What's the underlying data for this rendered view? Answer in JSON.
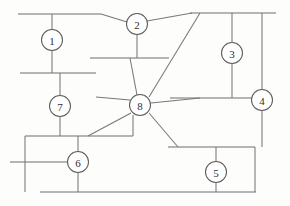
{
  "diagram": {
    "type": "single-line-network",
    "canvas": {
      "width": 290,
      "height": 206,
      "background": "#fdfdfc"
    },
    "style": {
      "line_color": "#6f6f72",
      "node_stroke": "#5d5d60",
      "node_fill": "#ffffff",
      "label_color": "#2f2f32"
    },
    "nodes": [
      {
        "id": "1",
        "label": "1",
        "cx": 52,
        "cy": 40,
        "r": 10.5
      },
      {
        "id": "2",
        "label": "2",
        "cx": 137,
        "cy": 24,
        "r": 10.5
      },
      {
        "id": "3",
        "label": "3",
        "cx": 232,
        "cy": 53,
        "r": 10.5
      },
      {
        "id": "4",
        "label": "4",
        "cx": 262,
        "cy": 100,
        "r": 10.5
      },
      {
        "id": "5",
        "label": "5",
        "cx": 216,
        "cy": 172,
        "r": 10.5
      },
      {
        "id": "6",
        "label": "6",
        "cx": 78,
        "cy": 162,
        "r": 10.5
      },
      {
        "id": "7",
        "label": "7",
        "cx": 60,
        "cy": 106,
        "r": 10.5
      },
      {
        "id": "8",
        "label": "8",
        "cx": 140,
        "cy": 105,
        "r": 10.5
      }
    ],
    "busbars": [
      {
        "name": "bus-top-left",
        "x1": 18,
        "y1": 14,
        "x2": 101,
        "y2": 14
      },
      {
        "name": "bus-top-right",
        "x1": 190,
        "y1": 13,
        "x2": 276,
        "y2": 13
      },
      {
        "name": "bus-mid-left",
        "x1": 20,
        "y1": 73,
        "x2": 96,
        "y2": 73
      },
      {
        "name": "bus-mid-center",
        "x1": 90,
        "y1": 58,
        "x2": 169,
        "y2": 58
      },
      {
        "name": "bus-mid-right",
        "x1": 170,
        "y1": 98,
        "x2": 251,
        "y2": 98
      },
      {
        "name": "bus-lower-left",
        "x1": 25,
        "y1": 136,
        "x2": 133,
        "y2": 136
      },
      {
        "name": "bus-node6-left",
        "x1": 10,
        "y1": 162,
        "x2": 68,
        "y2": 162
      },
      {
        "name": "bus-lower-right",
        "x1": 168,
        "y1": 147,
        "x2": 255,
        "y2": 147
      },
      {
        "name": "bus-bottom",
        "x1": 40,
        "y1": 192,
        "x2": 256,
        "y2": 192
      }
    ],
    "branches": [
      {
        "name": "drop-bus-top-left-to-node-1",
        "x1": 52,
        "y1": 14,
        "x2": 52,
        "y2": 29.5
      },
      {
        "name": "drop-node-1-to-bus-mid-left",
        "x1": 52,
        "y1": 50.5,
        "x2": 52,
        "y2": 73
      },
      {
        "name": "tie-bus-top-left-to-node-2",
        "x1": 101,
        "y1": 14,
        "x2": 127,
        "y2": 22
      },
      {
        "name": "tie-node-2-to-bus-top-right",
        "x1": 147,
        "y1": 21,
        "x2": 192,
        "y2": 13
      },
      {
        "name": "drop-node-2-to-bus-mid-center",
        "x1": 137,
        "y1": 34.5,
        "x2": 137,
        "y2": 58
      },
      {
        "name": "tie-bus-mid-center-to-node-8",
        "x1": 130,
        "y1": 58,
        "x2": 137,
        "y2": 95
      },
      {
        "name": "drop-bus-top-right-to-node-3",
        "x1": 232,
        "y1": 13,
        "x2": 232,
        "y2": 42.5
      },
      {
        "name": "drop-node-3-to-bus-mid-right",
        "x1": 232,
        "y1": 63.5,
        "x2": 232,
        "y2": 98
      },
      {
        "name": "drop-bus-top-right-to-node-4",
        "x1": 262,
        "y1": 13,
        "x2": 262,
        "y2": 89.5
      },
      {
        "name": "drop-node-4-to-bus-lower-right",
        "x1": 262,
        "y1": 110.5,
        "x2": 262,
        "y2": 147
      },
      {
        "name": "tie-node-8-to-bus-top-right",
        "x1": 149,
        "y1": 97,
        "x2": 200,
        "y2": 13
      },
      {
        "name": "stub-node-8-to-bus-mid-right",
        "x1": 151,
        "y1": 103,
        "x2": 200,
        "y2": 98
      },
      {
        "name": "tie-node-8-to-bus-lower-right",
        "x1": 149,
        "y1": 113,
        "x2": 178,
        "y2": 147
      },
      {
        "name": "drop-node-8-to-bus-lower-left",
        "x1": 133,
        "y1": 115,
        "x2": 133,
        "y2": 136
      },
      {
        "name": "tie-node-8-to-bus-node6-left",
        "x1": 131,
        "y1": 113,
        "x2": 88,
        "y2": 136
      },
      {
        "name": "tie-node-8-to-bus-mid-left",
        "x1": 130,
        "y1": 100,
        "x2": 96,
        "y2": 97
      },
      {
        "name": "drop-bus-mid-left-to-node-7",
        "x1": 60,
        "y1": 73,
        "x2": 60,
        "y2": 95.5
      },
      {
        "name": "drop-node-7-to-bus-lower-left",
        "x1": 60,
        "y1": 116.5,
        "x2": 60,
        "y2": 136
      },
      {
        "name": "drop-bus-lower-left-to-node-6",
        "x1": 78,
        "y1": 136,
        "x2": 78,
        "y2": 151.5
      },
      {
        "name": "drop-node-6-to-bus-bottom",
        "x1": 78,
        "y1": 172.5,
        "x2": 78,
        "y2": 192
      },
      {
        "name": "riser-left-edge",
        "x1": 25,
        "y1": 136,
        "x2": 25,
        "y2": 192
      },
      {
        "name": "drop-bus-lower-right-to-node-5",
        "x1": 216,
        "y1": 147,
        "x2": 216,
        "y2": 161.5
      },
      {
        "name": "drop-node-5-to-bus-bottom",
        "x1": 216,
        "y1": 182.5,
        "x2": 216,
        "y2": 192
      },
      {
        "name": "riser-bus-lower-right-right-edge",
        "x1": 255,
        "y1": 147,
        "x2": 255,
        "y2": 192
      }
    ]
  }
}
